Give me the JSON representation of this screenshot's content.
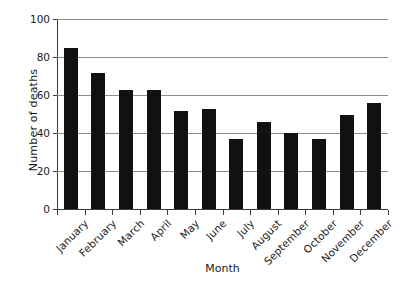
{
  "chart_data": {
    "type": "bar",
    "title": "",
    "xlabel": "Month",
    "ylabel": "Number of deaths",
    "categories": [
      "January",
      "February",
      "March",
      "April",
      "May",
      "June",
      "July",
      "August",
      "September",
      "October",
      "November",
      "December"
    ],
    "values": [
      85,
      72,
      63,
      63,
      52,
      53,
      37,
      46,
      40,
      37,
      50,
      56
    ],
    "ylim": [
      0,
      100
    ],
    "yticks": [
      0,
      20,
      40,
      60,
      80,
      100
    ],
    "ytick_labels": [
      "0",
      "20",
      "40",
      "60",
      "80",
      "100"
    ],
    "grid": true,
    "legend": null,
    "bar_color": "#111111",
    "gridline_color": "#8c8c8c",
    "axis_color": "#3a3a3a",
    "background": "#ffffff"
  }
}
